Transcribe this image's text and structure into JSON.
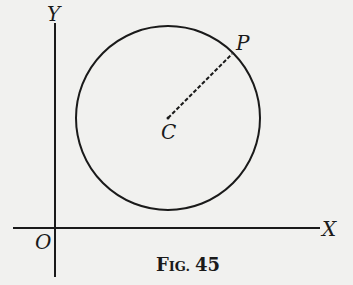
{
  "figure": {
    "caption_prefix": "F",
    "caption_smallcaps": "IG.",
    "caption_number": "45",
    "caption": "FIG. 45"
  },
  "labels": {
    "y_axis": "Y",
    "x_axis": "X",
    "origin": "O",
    "center": "C",
    "point": "P"
  },
  "colors": {
    "background": "#f1f1ef",
    "ink": "#1a1a1a"
  }
}
